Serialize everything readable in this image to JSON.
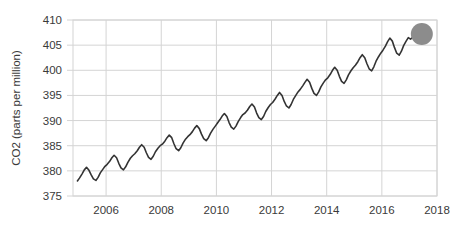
{
  "chart_data": {
    "type": "line",
    "title": "",
    "subtitle": "",
    "xlabel": "",
    "ylabel": "CO2 (parts per million)",
    "xlim": [
      2004.8,
      2018.0
    ],
    "ylim": [
      375,
      410
    ],
    "xticks": [
      2006,
      2008,
      2010,
      2012,
      2014,
      2016,
      2018
    ],
    "xtick_labels": [
      "2006",
      "2008",
      "2010",
      "2012",
      "2014",
      "2016",
      "2018"
    ],
    "yticks": [
      375,
      380,
      385,
      390,
      395,
      400,
      405,
      410
    ],
    "ytick_labels": [
      "375",
      "380",
      "385",
      "390",
      "395",
      "400",
      "405",
      "410"
    ],
    "grid": true,
    "grid_color": "#d4d4d4",
    "legend": false,
    "legend_position": "none",
    "line_color": "#333333",
    "line_width": 1.6,
    "marker": {
      "name": "endpoint-marker",
      "shape": "circle",
      "x": 2017.45,
      "y": 407.2,
      "radius_px": 11,
      "color": "#8c8c8c"
    },
    "series": [
      {
        "name": "Atmospheric CO2",
        "x": [
          2004.96,
          2005.04,
          2005.13,
          2005.21,
          2005.29,
          2005.38,
          2005.46,
          2005.54,
          2005.63,
          2005.71,
          2005.79,
          2005.88,
          2005.96,
          2006.04,
          2006.13,
          2006.21,
          2006.29,
          2006.38,
          2006.46,
          2006.54,
          2006.63,
          2006.71,
          2006.79,
          2006.88,
          2006.96,
          2007.04,
          2007.13,
          2007.21,
          2007.29,
          2007.38,
          2007.46,
          2007.54,
          2007.63,
          2007.71,
          2007.79,
          2007.88,
          2007.96,
          2008.04,
          2008.13,
          2008.21,
          2008.29,
          2008.38,
          2008.46,
          2008.54,
          2008.63,
          2008.71,
          2008.79,
          2008.88,
          2008.96,
          2009.04,
          2009.13,
          2009.21,
          2009.29,
          2009.38,
          2009.46,
          2009.54,
          2009.63,
          2009.71,
          2009.79,
          2009.88,
          2009.96,
          2010.04,
          2010.13,
          2010.21,
          2010.29,
          2010.38,
          2010.46,
          2010.54,
          2010.63,
          2010.71,
          2010.79,
          2010.88,
          2010.96,
          2011.04,
          2011.13,
          2011.21,
          2011.29,
          2011.38,
          2011.46,
          2011.54,
          2011.63,
          2011.71,
          2011.79,
          2011.88,
          2011.96,
          2012.04,
          2012.13,
          2012.21,
          2012.29,
          2012.38,
          2012.46,
          2012.54,
          2012.63,
          2012.71,
          2012.79,
          2012.88,
          2012.96,
          2013.04,
          2013.13,
          2013.21,
          2013.29,
          2013.38,
          2013.46,
          2013.54,
          2013.63,
          2013.71,
          2013.79,
          2013.88,
          2013.96,
          2014.04,
          2014.13,
          2014.21,
          2014.29,
          2014.38,
          2014.46,
          2014.54,
          2014.63,
          2014.71,
          2014.79,
          2014.88,
          2014.96,
          2015.04,
          2015.13,
          2015.21,
          2015.29,
          2015.38,
          2015.46,
          2015.54,
          2015.63,
          2015.71,
          2015.79,
          2015.88,
          2015.96,
          2016.04,
          2016.13,
          2016.21,
          2016.29,
          2016.38,
          2016.46,
          2016.54,
          2016.63,
          2016.71,
          2016.79,
          2016.88,
          2016.96,
          2017.04,
          2017.13,
          2017.21,
          2017.29,
          2017.38,
          2017.45
        ],
        "y": [
          378.0,
          378.6,
          379.4,
          380.2,
          380.7,
          380.1,
          379.2,
          378.4,
          378.1,
          378.7,
          379.6,
          380.3,
          380.9,
          381.3,
          381.9,
          382.6,
          383.1,
          382.6,
          381.5,
          380.6,
          380.2,
          380.8,
          381.7,
          382.5,
          383.0,
          383.4,
          384.0,
          384.7,
          385.2,
          384.7,
          383.6,
          382.7,
          382.3,
          382.9,
          383.8,
          384.5,
          385.0,
          385.3,
          385.9,
          386.6,
          387.1,
          386.6,
          385.4,
          384.4,
          384.0,
          384.6,
          385.5,
          386.3,
          386.8,
          387.2,
          387.8,
          388.5,
          389.0,
          388.4,
          387.3,
          386.4,
          386.0,
          386.6,
          387.5,
          388.3,
          388.9,
          389.5,
          390.2,
          390.9,
          391.4,
          390.8,
          389.6,
          388.7,
          388.3,
          388.9,
          389.8,
          390.6,
          391.2,
          391.5,
          392.1,
          392.8,
          393.3,
          392.7,
          391.5,
          390.6,
          390.2,
          390.8,
          391.8,
          392.6,
          393.2,
          393.6,
          394.3,
          395.0,
          395.6,
          395.0,
          393.8,
          392.9,
          392.5,
          393.2,
          394.2,
          395.0,
          395.7,
          396.2,
          396.9,
          397.6,
          398.2,
          397.6,
          396.4,
          395.4,
          395.0,
          395.7,
          396.7,
          397.5,
          398.1,
          398.5,
          399.2,
          400.0,
          400.6,
          400.0,
          398.8,
          397.8,
          397.4,
          398.1,
          399.1,
          399.9,
          400.5,
          401.0,
          401.7,
          402.5,
          403.1,
          402.5,
          401.3,
          400.3,
          399.9,
          400.7,
          401.8,
          402.7,
          403.4,
          404.0,
          404.8,
          405.7,
          406.4,
          405.8,
          404.5,
          403.4,
          403.0,
          403.8,
          404.9,
          405.8,
          406.5,
          406.2,
          406.6,
          407.3,
          407.8,
          407.5,
          407.2
        ]
      }
    ]
  }
}
